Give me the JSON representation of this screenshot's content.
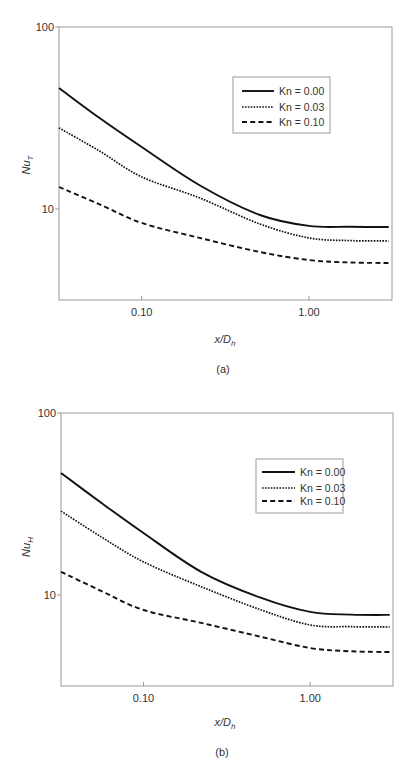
{
  "chart_data": [
    {
      "type": "line",
      "panel_label": "(a)",
      "title": "",
      "xlabel": "x/D_h",
      "xlabel_main": "x/D",
      "xlabel_sub": "h",
      "ylabel": "Nu_T",
      "ylabel_main": "Nu",
      "ylabel_sub": "T",
      "xscale": "log",
      "yscale": "log",
      "xlim": [
        0.032,
        3.14
      ],
      "ylim": [
        3.16,
        100
      ],
      "xticks": [
        0.1,
        1.0
      ],
      "xtick_labels": [
        "0.10",
        "1.00"
      ],
      "yticks": [
        10,
        100
      ],
      "ytick_labels": [
        "10",
        "100"
      ],
      "grid": false,
      "legend_position": "upper right",
      "x": [
        0.032,
        0.056,
        0.1,
        0.222,
        0.509,
        1.0,
        1.76,
        3.0
      ],
      "series": [
        {
          "name": "Kn = 0.00",
          "style": "solid",
          "values": [
            46.2,
            31.6,
            21.9,
            13.5,
            9.27,
            8.07,
            7.98,
            7.96
          ]
        },
        {
          "name": "Kn = 0.03",
          "style": "dotted",
          "values": [
            27.9,
            20.8,
            15.0,
            11.5,
            8.27,
            6.93,
            6.7,
            6.67
          ]
        },
        {
          "name": "Kn = 0.10",
          "style": "dashed",
          "values": [
            13.2,
            10.6,
            8.38,
            6.93,
            5.8,
            5.24,
            5.08,
            5.05
          ]
        }
      ]
    },
    {
      "type": "line",
      "panel_label": "(b)",
      "title": "",
      "xlabel": "x/D_h",
      "xlabel_main": "x/D",
      "xlabel_sub": "h",
      "ylabel": "Nu_H",
      "ylabel_main": "Nu",
      "ylabel_sub": "H",
      "xscale": "log",
      "yscale": "log",
      "xlim": [
        0.032,
        3.14
      ],
      "ylim": [
        3.16,
        100
      ],
      "xticks": [
        0.1,
        1.0
      ],
      "xtick_labels": [
        "0.10",
        "1.00"
      ],
      "yticks": [
        10,
        100
      ],
      "ytick_labels": [
        "10",
        "100"
      ],
      "grid": false,
      "legend_position": "upper right",
      "x": [
        0.032,
        0.056,
        0.1,
        0.222,
        0.509,
        1.0,
        1.76,
        3.0
      ],
      "series": [
        {
          "name": "Kn = 0.00",
          "style": "solid",
          "values": [
            46.8,
            32.0,
            21.9,
            13.4,
            9.63,
            8.07,
            7.8,
            7.77
          ]
        },
        {
          "name": "Kn = 0.03",
          "style": "dotted",
          "values": [
            28.9,
            20.8,
            15.2,
            11.1,
            8.27,
            6.84,
            6.69,
            6.67
          ]
        },
        {
          "name": "Kn = 0.10",
          "style": "dashed",
          "values": [
            13.4,
            10.5,
            8.27,
            7.02,
            5.88,
            5.11,
            4.9,
            4.86
          ]
        }
      ]
    }
  ],
  "colors": {
    "line": "#111111",
    "frame": "#9a9a9a",
    "text": "#333333",
    "background": "#ffffff"
  }
}
